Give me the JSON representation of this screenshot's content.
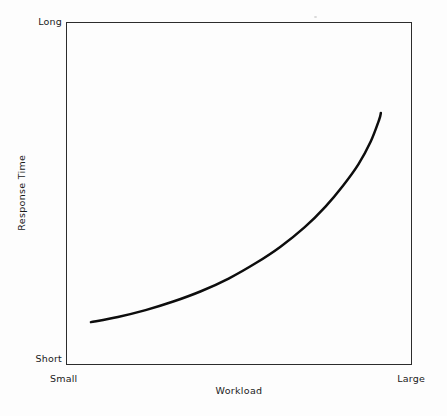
{
  "chart_data": {
    "type": "line",
    "title": "",
    "subtitle": "",
    "xlabel": "Workload",
    "ylabel": "Response Time",
    "x_tick_labels": [
      "Small",
      "Large"
    ],
    "y_tick_labels": [
      "Short",
      "Long"
    ],
    "xlim": [
      0,
      1
    ],
    "ylim": [
      0,
      1
    ],
    "grid": false,
    "legend": null,
    "annotations": [],
    "series": [
      {
        "name": "Response time vs workload",
        "description": "Monotonically increasing convex (exponential) curve: response time rises slowly at low workload then climbs steeply as workload approaches capacity.",
        "color": "#0d0d0d",
        "line_width": 2.5,
        "x": [
          0.072,
          0.15,
          0.23,
          0.31,
          0.39,
          0.47,
          0.55,
          0.62,
          0.69,
          0.75,
          0.8,
          0.845,
          0.88,
          0.905,
          0.91
        ],
        "y": [
          0.125,
          0.14,
          0.16,
          0.185,
          0.215,
          0.252,
          0.298,
          0.345,
          0.402,
          0.462,
          0.522,
          0.585,
          0.65,
          0.715,
          0.735
        ]
      }
    ]
  },
  "labels": {
    "y_top": "Long",
    "y_bottom": "Short",
    "x_left": "Small",
    "x_right": "Large",
    "y_axis_title": "Response Time",
    "x_axis_title": "Workload"
  },
  "style": {
    "background": "#fdfdfd",
    "frame_color": "#2c2c2c",
    "curve_color": "#0d0d0d",
    "text_color": "#1a1a1a"
  }
}
